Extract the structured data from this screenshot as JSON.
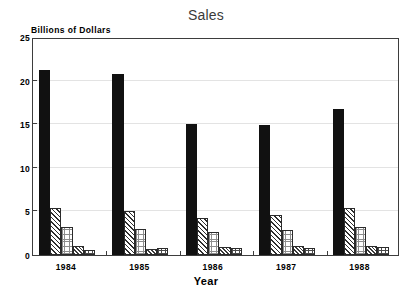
{
  "chart_data": {
    "type": "bar",
    "title": "Sales",
    "xlabel": "Year",
    "ylabel": "Billions of Dollars",
    "categories": [
      "1984",
      "1985",
      "1986",
      "1987",
      "1988"
    ],
    "ylim": [
      0,
      25
    ],
    "yticks": [
      0,
      5,
      10,
      15,
      20,
      25
    ],
    "ytick_labels": [
      "0",
      "5",
      "10",
      "15",
      "20",
      "25"
    ],
    "grid": true,
    "legend": "none",
    "series": [
      {
        "name": "series-1",
        "pattern": "solid-black",
        "values": [
          21.2,
          20.8,
          15.0,
          14.9,
          16.8
        ]
      },
      {
        "name": "series-2",
        "pattern": "diagonal-hatch",
        "values": [
          5.35,
          5.1,
          4.3,
          4.6,
          5.4
        ]
      },
      {
        "name": "series-3",
        "pattern": "light-stipple",
        "values": [
          3.25,
          2.95,
          2.6,
          2.9,
          3.2
        ]
      },
      {
        "name": "series-4",
        "pattern": "dark-checker",
        "values": [
          1.0,
          0.65,
          0.9,
          1.0,
          1.0
        ]
      },
      {
        "name": "series-5",
        "pattern": "light-grid",
        "values": [
          0.6,
          0.75,
          0.75,
          0.85,
          0.95
        ]
      }
    ]
  }
}
